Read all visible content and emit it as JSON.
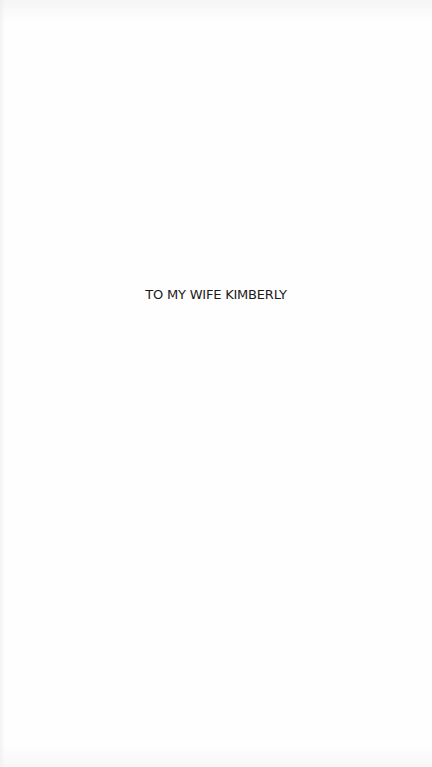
{
  "page": {
    "type": "dedication",
    "dedication_text": "TO MY WIFE KIMBERLY"
  },
  "colors": {
    "background": "#fefefe",
    "text": "#1a1a1a"
  }
}
